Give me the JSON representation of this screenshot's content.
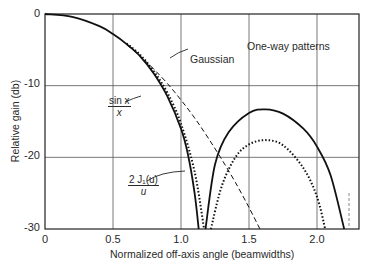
{
  "chart_data": {
    "type": "line",
    "title": "One-way patterns",
    "xlabel": "Normalized off-axis angle (beamwidths)",
    "ylabel": "Relative gain (db)",
    "xlim": [
      0,
      2.31
    ],
    "ylim": [
      -30,
      0
    ],
    "grid": true,
    "x_ticks": [
      "0",
      "0.5",
      "1.0",
      "1.5",
      "2.0"
    ],
    "y_ticks": [
      "0",
      "-10",
      "-20",
      "-30"
    ],
    "series": [
      {
        "name": "sin x / x",
        "style": "solid",
        "segments": [
          [
            [
              0,
              0
            ],
            [
              0.2,
              -0.4
            ],
            [
              0.4,
              -1.7
            ],
            [
              0.5,
              -2.8
            ],
            [
              0.6,
              -4.2
            ],
            [
              0.7,
              -5.9
            ],
            [
              0.8,
              -8.3
            ],
            [
              0.9,
              -11.5
            ],
            [
              1.0,
              -16
            ],
            [
              1.05,
              -19.5
            ],
            [
              1.1,
              -25
            ],
            [
              1.13,
              -30
            ]
          ],
          [
            [
              1.18,
              -30
            ],
            [
              1.25,
              -21
            ],
            [
              1.35,
              -16.5
            ],
            [
              1.5,
              -13.8
            ],
            [
              1.62,
              -13.3
            ],
            [
              1.75,
              -13.9
            ],
            [
              1.9,
              -16
            ],
            [
              2.0,
              -18.5
            ],
            [
              2.1,
              -22.5
            ],
            [
              2.2,
              -30
            ]
          ]
        ]
      },
      {
        "name": "2 J1(u) / u",
        "style": "dotted",
        "segments": [
          [
            [
              0.6,
              -4.1
            ],
            [
              0.7,
              -5.7
            ],
            [
              0.8,
              -8.0
            ],
            [
              0.9,
              -11
            ],
            [
              1.0,
              -15.3
            ],
            [
              1.1,
              -22
            ],
            [
              1.17,
              -30
            ]
          ],
          [
            [
              1.22,
              -30
            ],
            [
              1.3,
              -24
            ],
            [
              1.4,
              -20
            ],
            [
              1.5,
              -18.2
            ],
            [
              1.62,
              -17.6
            ],
            [
              1.75,
              -18.3
            ],
            [
              1.9,
              -21.5
            ],
            [
              2.0,
              -25.5
            ],
            [
              2.06,
              -30
            ]
          ]
        ]
      },
      {
        "name": "Gaussian",
        "style": "dashed",
        "segments": [
          [
            [
              0.6,
              -4.3
            ],
            [
              0.7,
              -5.9
            ],
            [
              0.8,
              -7.7
            ],
            [
              0.9,
              -9.7
            ],
            [
              1.0,
              -12
            ],
            [
              1.1,
              -14.5
            ],
            [
              1.2,
              -17.3
            ],
            [
              1.3,
              -20.3
            ],
            [
              1.4,
              -23.5
            ],
            [
              1.5,
              -27
            ],
            [
              1.58,
              -30
            ]
          ]
        ]
      }
    ],
    "annotations": [
      {
        "text": "Gaussian",
        "points_to": "dashed curve near x=0.8"
      },
      {
        "text": "sin x / x",
        "points_to": "solid curve near x=0.92"
      },
      {
        "text": "2 J1(u) / u",
        "points_to": "dotted curve near x=1.05"
      },
      {
        "text": "One-way patterns",
        "position": "upper right"
      }
    ]
  },
  "labels": {
    "title": "One-way patterns",
    "xlabel": "Normalized off-axis angle (beamwidths)",
    "ylabel": "Relative gain (db)",
    "gaussian": "Gaussian",
    "sinx_num": "sin x",
    "sinx_den": "x",
    "bessel_num": "2 J₁(u)",
    "bessel_den": "u",
    "xticks": [
      "0",
      "0.5",
      "1.0",
      "1.5",
      "2.0"
    ],
    "yticks": [
      "0",
      "-10",
      "-20",
      "-30"
    ]
  }
}
